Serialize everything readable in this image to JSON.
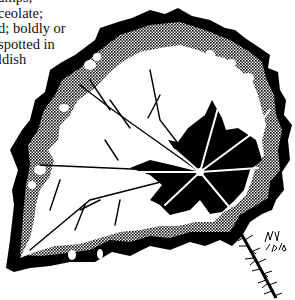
{
  "caption": {
    "lines": [
      "amps;",
      "ceolate;",
      "d; boldly or",
      "spotted in",
      "ldish"
    ]
  },
  "illustration": {
    "subject": "begonia-leaf-drawing",
    "signature": "JLJ 10/76",
    "colors": {
      "ink": "#000000",
      "paper": "#ffffff",
      "halftone": "#555555"
    }
  }
}
